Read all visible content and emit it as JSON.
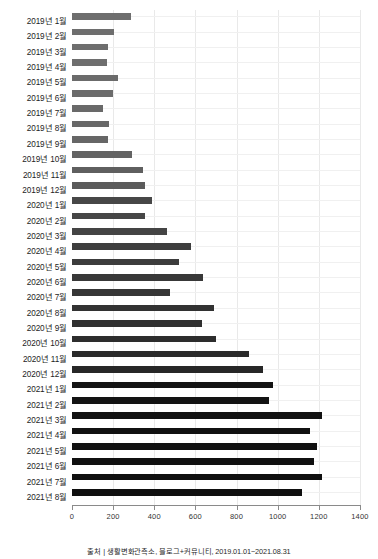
{
  "chart_data": {
    "type": "bar",
    "orientation": "horizontal",
    "title": "",
    "xlabel": "",
    "ylabel": "",
    "xlim": [
      0,
      1400
    ],
    "xticks": [
      0,
      200,
      400,
      600,
      800,
      1000,
      1200,
      1400
    ],
    "grid": true,
    "categories": [
      "2019년 1월",
      "2019년 2월",
      "2019년 3월",
      "2019년 4월",
      "2019년 5월",
      "2019년 6월",
      "2019년 7월",
      "2019년 8월",
      "2019년 9월",
      "2019년 10월",
      "2019년 11월",
      "2019년 12월",
      "2020년 1월",
      "2020년 2월",
      "2020년 3월",
      "2020년 4월",
      "2020년 5월",
      "2020년 6월",
      "2020년 7월",
      "2020년 8월",
      "2020년 9월",
      "2020년 10월",
      "2020년 11월",
      "2020년 12월",
      "2021년 1월",
      "2021년 2월",
      "2021년 3월",
      "2021년 4월",
      "2021년 5월",
      "2021년 6월",
      "2021년 7월",
      "2021년 8월"
    ],
    "values": [
      285,
      205,
      175,
      170,
      225,
      200,
      150,
      180,
      175,
      290,
      345,
      355,
      390,
      355,
      460,
      580,
      520,
      635,
      475,
      690,
      630,
      700,
      860,
      930,
      975,
      960,
      1215,
      1155,
      1190,
      1175,
      1215,
      1120
    ],
    "bar_colors": [
      "#6e6e6e",
      "#6e6e6e",
      "#6e6e6e",
      "#6e6e6e",
      "#6b6b6b",
      "#6b6b6b",
      "#696969",
      "#686868",
      "#666666",
      "#636363",
      "#5f5f5f",
      "#5b5b5b",
      "#474747",
      "#464646",
      "#444444",
      "#3e3e3e",
      "#3c3c3c",
      "#383838",
      "#363636",
      "#323232",
      "#303030",
      "#2d2d2d",
      "#2a2a2a",
      "#272727",
      "#141414",
      "#131313",
      "#121212",
      "#111111",
      "#111111",
      "#101010",
      "#101010",
      "#0f0f0f"
    ]
  },
  "caption": {
    "text": "출처 | 생활변화관측소, 블로그+커뮤니티, 2019.01.01~2021.08.31"
  },
  "colors": {
    "axis": "#8a8a8a",
    "grid": "#e9e9e9",
    "track": "#f0f0f0",
    "background": "#ffffff"
  }
}
